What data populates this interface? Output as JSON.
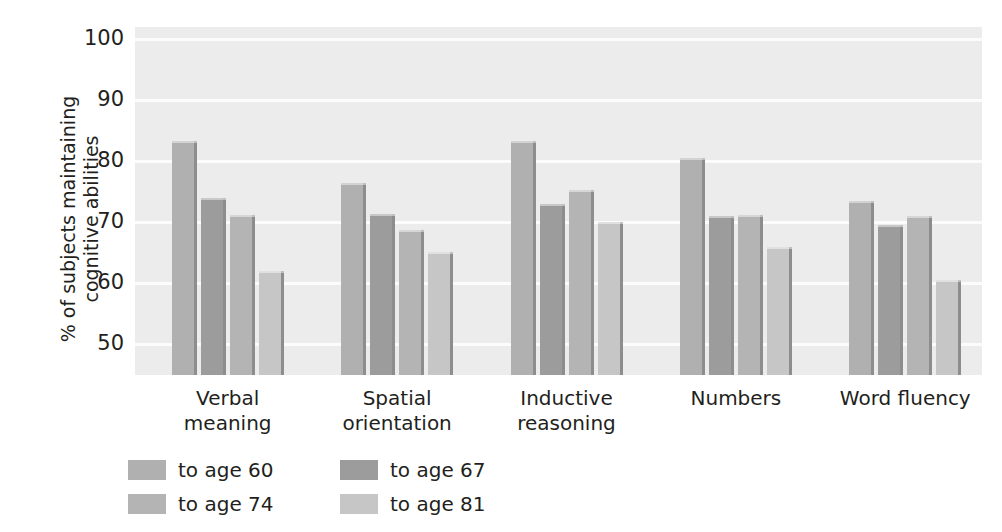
{
  "chart_data": {
    "type": "bar",
    "title": "",
    "subtitle": "",
    "xlabel": "",
    "ylabel": "% of subjects maintaining\ncognitive abilities",
    "ylim": [
      45,
      102
    ],
    "yticks": [
      50,
      60,
      70,
      80,
      90,
      100
    ],
    "ytick_labels": [
      "50",
      "60",
      "70",
      "80",
      "90",
      "100"
    ],
    "grid": "horizontal",
    "legend_position": "bottom-left",
    "categories": [
      "Verbal\nmeaning",
      "Spatial\norientation",
      "Inductive\nreasoning",
      "Numbers",
      "Word fluency"
    ],
    "series": [
      {
        "name": "to age 60",
        "color": "#b0b0b0",
        "values": [
          83.4,
          76.5,
          83.3,
          80.6,
          73.5
        ]
      },
      {
        "name": "to age 67",
        "color": "#9c9c9c",
        "values": [
          74.0,
          71.3,
          73.0,
          71.1,
          69.6
        ]
      },
      {
        "name": "to age 74",
        "color": "#b4b4b4",
        "values": [
          71.2,
          68.7,
          75.3,
          71.2,
          71.1
        ]
      },
      {
        "name": "to age 81",
        "color": "#c6c6c6",
        "values": [
          62.0,
          65.2,
          70.0,
          65.9,
          60.5
        ]
      }
    ],
    "plot_background": "#ececec",
    "gridline_color": "#fcfcfc",
    "text_color": "#231f20"
  }
}
